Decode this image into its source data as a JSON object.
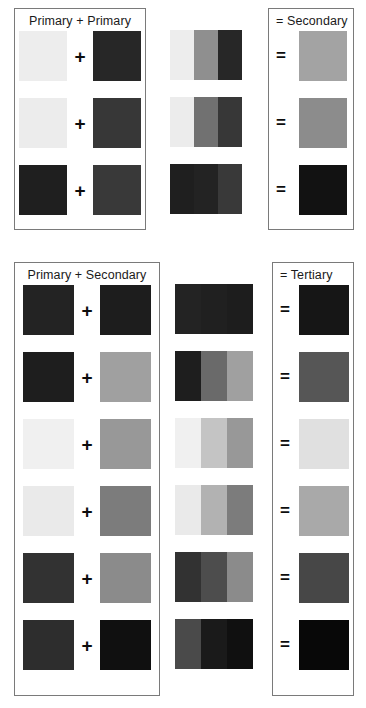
{
  "figure": {
    "type": "color-mixing-chart"
  },
  "operators": {
    "plus": "+",
    "equals": "="
  },
  "section_primary": {
    "title": "Primary + Primary",
    "mix_panel_title": "",
    "result_title": "= Secondary",
    "rows": [
      {
        "left_swatch": "#ededed",
        "right_swatch": "#272727",
        "operator": "+",
        "mix_bands": [
          "#ededed",
          "#8f8f8f",
          "#272727"
        ],
        "result_operator": "=",
        "result_swatch": "#a3a3a3"
      },
      {
        "left_swatch": "#ececec",
        "right_swatch": "#373737",
        "operator": "+",
        "mix_bands": [
          "#ececec",
          "#717171",
          "#373737"
        ],
        "result_operator": "=",
        "result_swatch": "#8c8c8c"
      },
      {
        "left_swatch": "#1f1f1f",
        "right_swatch": "#393939",
        "operator": "+",
        "mix_bands": [
          "#1f1f1f",
          "#232323",
          "#393939"
        ],
        "result_operator": "=",
        "result_swatch": "#121212"
      }
    ]
  },
  "section_tertiary": {
    "title": "Primary + Secondary",
    "mix_panel_title": "",
    "result_title": "= Tertiary",
    "rows": [
      {
        "left_swatch": "#232323",
        "right_swatch": "#1d1d1d",
        "operator": "+",
        "mix_bands": [
          "#232323",
          "#202020",
          "#1d1d1d"
        ],
        "result_operator": "=",
        "result_swatch": "#161616"
      },
      {
        "left_swatch": "#1e1e1e",
        "right_swatch": "#a0a0a0",
        "operator": "+",
        "mix_bands": [
          "#1e1e1e",
          "#6a6a6a",
          "#a0a0a0"
        ],
        "result_operator": "=",
        "result_swatch": "#565656"
      },
      {
        "left_swatch": "#f0f0f0",
        "right_swatch": "#989898",
        "operator": "+",
        "mix_bands": [
          "#f0f0f0",
          "#c4c4c4",
          "#989898"
        ],
        "result_operator": "=",
        "result_swatch": "#e0e0e0"
      },
      {
        "left_swatch": "#eaeaea",
        "right_swatch": "#7c7c7c",
        "operator": "+",
        "mix_bands": [
          "#eaeaea",
          "#b2b2b2",
          "#7c7c7c"
        ],
        "result_operator": "=",
        "result_swatch": "#a9a9a9"
      },
      {
        "left_swatch": "#323232",
        "right_swatch": "#8b8b8b",
        "operator": "+",
        "mix_bands": [
          "#323232",
          "#4d4d4d",
          "#8b8b8b"
        ],
        "result_operator": "=",
        "result_swatch": "#474747"
      },
      {
        "left_swatch": "#2d2d2d",
        "right_swatch": "#101010",
        "operator": "+",
        "mix_bands": [
          "#4a4a4a",
          "#1a1a1a",
          "#101010"
        ],
        "result_operator": "=",
        "result_swatch": "#080808"
      }
    ]
  }
}
